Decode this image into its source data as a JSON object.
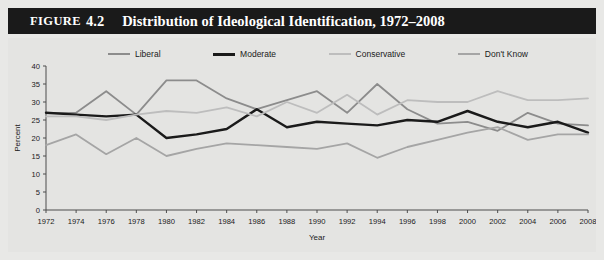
{
  "figure": {
    "label": "Figure",
    "number": "4.2",
    "title": "Distribution of Ideological Identification, 1972–2008"
  },
  "legend": {
    "position": "top",
    "items": [
      {
        "label": "Liberal",
        "color": "#8c8c8c"
      },
      {
        "label": "Moderate",
        "color": "#1a1a1a"
      },
      {
        "label": "Conservative",
        "color": "#bdbdbd"
      },
      {
        "label": "Don't Know",
        "color": "#a5a5a5"
      }
    ]
  },
  "chart_data": {
    "type": "line",
    "xlabel": "Year",
    "ylabel": "Percent",
    "xlim": [
      1972,
      2008
    ],
    "ylim": [
      0,
      40
    ],
    "ytick_step": 5,
    "grid": false,
    "legend_position": "top",
    "x": [
      1972,
      1974,
      1976,
      1978,
      1980,
      1982,
      1984,
      1986,
      1988,
      1990,
      1992,
      1994,
      1996,
      1998,
      2000,
      2002,
      2004,
      2006,
      2008
    ],
    "categories": [
      "1972",
      "1974",
      "1976",
      "1978",
      "1980",
      "1982",
      "1984",
      "1986",
      "1988",
      "1990",
      "1992",
      "1994",
      "1996",
      "1998",
      "2000",
      "2002",
      "2004",
      "2006",
      "2008"
    ],
    "yticks": [
      0,
      5,
      10,
      15,
      20,
      25,
      30,
      35,
      40
    ],
    "series": [
      {
        "name": "Liberal",
        "color": "#8c8c8c",
        "values": [
          27.0,
          27.0,
          33.0,
          26.5,
          36.0,
          36.0,
          31.0,
          28.0,
          30.5,
          33.0,
          27.0,
          35.0,
          28.0,
          24.0,
          24.5,
          22.0,
          27.0,
          24.0,
          23.5
        ]
      },
      {
        "name": "Moderate",
        "color": "#1a1a1a",
        "values": [
          27.0,
          26.5,
          26.0,
          26.5,
          20.0,
          21.0,
          22.5,
          28.0,
          23.0,
          24.5,
          24.0,
          23.5,
          25.0,
          24.5,
          27.5,
          24.5,
          23.0,
          24.5,
          21.5
        ]
      },
      {
        "name": "Conservative",
        "color": "#bdbdbd",
        "values": [
          26.0,
          26.0,
          25.0,
          26.5,
          27.5,
          27.0,
          28.5,
          26.0,
          30.0,
          27.0,
          32.0,
          26.5,
          30.5,
          30.0,
          30.0,
          33.0,
          30.5,
          30.5,
          31.0
        ]
      },
      {
        "name": "Don't Know",
        "color": "#a5a5a5",
        "values": [
          18.0,
          21.0,
          15.5,
          20.0,
          15.0,
          17.0,
          18.5,
          18.0,
          17.5,
          17.0,
          18.5,
          14.5,
          17.5,
          19.5,
          21.5,
          23.0,
          19.5,
          21.0,
          21.0
        ]
      }
    ]
  }
}
